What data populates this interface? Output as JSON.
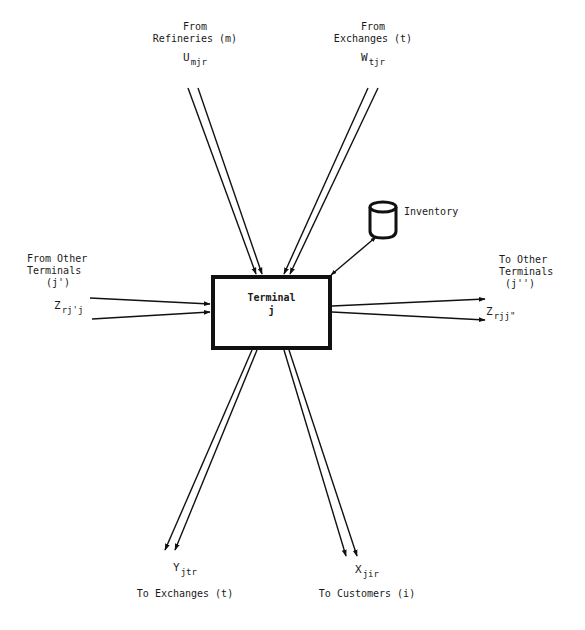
{
  "diagram": {
    "type": "flow-network-node",
    "node": {
      "title": "Terminal",
      "subscript": "j"
    },
    "storage": {
      "label": "Inventory",
      "icon": "cylinder-icon",
      "connection": "bidirectional"
    },
    "flows": [
      {
        "id": "refineries-in",
        "direction": "in",
        "source_title": "From",
        "source_name": "Refineries (m)",
        "var_main": "U",
        "var_sub": "mjr"
      },
      {
        "id": "exchanges-in",
        "direction": "in",
        "source_title": "From",
        "source_name": "Exchanges (t)",
        "var_main": "W",
        "var_sub": "tjr"
      },
      {
        "id": "terminals-in",
        "direction": "in",
        "source_line1": "From Other",
        "source_line2": "Terminals",
        "source_line3": "(j')",
        "var_main": "Z",
        "var_sub": "rj'j"
      },
      {
        "id": "terminals-out",
        "direction": "out",
        "dest_line1": "To Other",
        "dest_line2": "Terminals",
        "dest_line3": "(j'')",
        "var_main": "Z",
        "var_sub": "rjj\""
      },
      {
        "id": "exchanges-out",
        "direction": "out",
        "var_main": "Y",
        "var_sub": "jtr",
        "dest_name": "To Exchanges (t)"
      },
      {
        "id": "customers-out",
        "direction": "out",
        "var_main": "X",
        "var_sub": "jir",
        "dest_name": "To Customers (i)"
      }
    ],
    "colors": {
      "line": "#111111",
      "background": "#ffffff",
      "text": "#1a1a1a"
    }
  }
}
